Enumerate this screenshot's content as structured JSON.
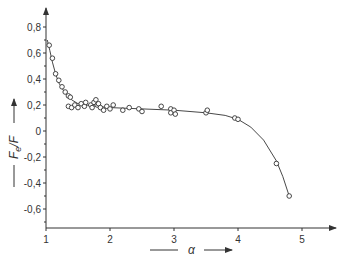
{
  "chart_data": {
    "type": "scatter",
    "title": "",
    "xlabel": "α",
    "ylabel": "F_e/F",
    "ylabel_main": "F",
    "ylabel_sub": "e",
    "ylabel_tail": "/F",
    "xlim": [
      1,
      5.5
    ],
    "ylim": [
      -0.7,
      0.9
    ],
    "grid": false,
    "legend": null,
    "x_ticks": [
      1,
      2,
      3,
      4,
      5
    ],
    "x_tick_labels": [
      "1",
      "2",
      "3",
      "4",
      "5"
    ],
    "y_ticks": [
      0.8,
      0.6,
      0.4,
      0.2,
      0,
      -0.2,
      -0.4,
      -0.6
    ],
    "y_tick_labels": [
      "0,8",
      "0,6",
      "0,4",
      "0,2",
      "0",
      "-0,2",
      "-0,4",
      "-0,6"
    ],
    "series": [
      {
        "name": "measured",
        "marker": "open-circle",
        "points": [
          [
            1.05,
            0.66
          ],
          [
            1.1,
            0.56
          ],
          [
            1.15,
            0.44
          ],
          [
            1.2,
            0.39
          ],
          [
            1.25,
            0.34
          ],
          [
            1.3,
            0.3
          ],
          [
            1.35,
            0.27
          ],
          [
            1.38,
            0.26
          ],
          [
            1.35,
            0.19
          ],
          [
            1.4,
            0.18
          ],
          [
            1.45,
            0.2
          ],
          [
            1.5,
            0.18
          ],
          [
            1.55,
            0.21
          ],
          [
            1.6,
            0.19
          ],
          [
            1.62,
            0.22
          ],
          [
            1.7,
            0.2
          ],
          [
            1.72,
            0.18
          ],
          [
            1.75,
            0.22
          ],
          [
            1.78,
            0.24
          ],
          [
            1.8,
            0.2
          ],
          [
            1.82,
            0.21
          ],
          [
            1.85,
            0.18
          ],
          [
            1.9,
            0.16
          ],
          [
            1.95,
            0.19
          ],
          [
            2.0,
            0.17
          ],
          [
            2.05,
            0.2
          ],
          [
            2.2,
            0.16
          ],
          [
            2.3,
            0.18
          ],
          [
            2.45,
            0.17
          ],
          [
            2.5,
            0.15
          ],
          [
            2.8,
            0.19
          ],
          [
            2.95,
            0.17
          ],
          [
            2.95,
            0.14
          ],
          [
            3.0,
            0.16
          ],
          [
            3.02,
            0.13
          ],
          [
            3.5,
            0.14
          ],
          [
            3.52,
            0.16
          ],
          [
            3.95,
            0.1
          ],
          [
            4.0,
            0.09
          ],
          [
            4.6,
            -0.25
          ],
          [
            4.8,
            -0.5
          ]
        ]
      },
      {
        "name": "fitted curve",
        "marker": "line",
        "points": [
          [
            1.02,
            0.7
          ],
          [
            1.06,
            0.62
          ],
          [
            1.1,
            0.53
          ],
          [
            1.15,
            0.44
          ],
          [
            1.2,
            0.37
          ],
          [
            1.3,
            0.29
          ],
          [
            1.4,
            0.24
          ],
          [
            1.5,
            0.21
          ],
          [
            1.7,
            0.195
          ],
          [
            2.0,
            0.18
          ],
          [
            2.5,
            0.17
          ],
          [
            3.0,
            0.16
          ],
          [
            3.5,
            0.14
          ],
          [
            3.8,
            0.12
          ],
          [
            4.0,
            0.09
          ],
          [
            4.2,
            0.03
          ],
          [
            4.4,
            -0.07
          ],
          [
            4.6,
            -0.23
          ],
          [
            4.7,
            -0.35
          ],
          [
            4.8,
            -0.5
          ]
        ]
      }
    ]
  },
  "axes": {
    "x_label": "α",
    "y_label_main": "F",
    "y_label_sub": "e",
    "y_label_tail": "/F"
  }
}
